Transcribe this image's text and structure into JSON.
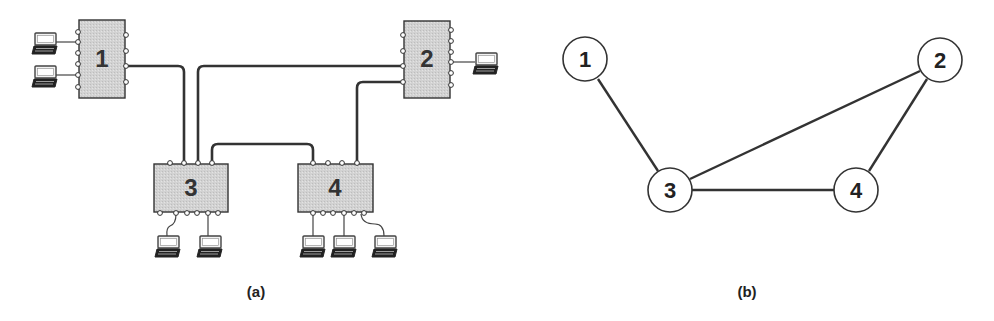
{
  "colors": {
    "stroke": "#333333",
    "switch_fill": "#d4d4d4",
    "node_fill": "#ffffff",
    "background": "#ffffff"
  },
  "panel_a": {
    "caption": "(a)",
    "switches": [
      {
        "id": "1",
        "label": "1",
        "x": 79,
        "y": 20,
        "w": 46,
        "h": 78
      },
      {
        "id": "2",
        "label": "2",
        "x": 404,
        "y": 21,
        "w": 46,
        "h": 77
      },
      {
        "id": "3",
        "label": "3",
        "x": 154,
        "y": 164,
        "w": 74,
        "h": 48
      },
      {
        "id": "4",
        "label": "4",
        "x": 298,
        "y": 164,
        "w": 75,
        "h": 48
      }
    ],
    "links": [
      {
        "from": "1",
        "to": "3"
      },
      {
        "from": "3",
        "to": "2"
      },
      {
        "from": "2",
        "to": "4"
      },
      {
        "from": "3",
        "to": "4"
      }
    ],
    "hosts": [
      {
        "attached_to": "1",
        "icon": "laptop-icon"
      },
      {
        "attached_to": "1",
        "icon": "laptop-icon"
      },
      {
        "attached_to": "2",
        "icon": "laptop-icon"
      },
      {
        "attached_to": "3",
        "icon": "laptop-icon"
      },
      {
        "attached_to": "3",
        "icon": "laptop-icon"
      },
      {
        "attached_to": "4",
        "icon": "laptop-icon"
      },
      {
        "attached_to": "4",
        "icon": "laptop-icon"
      },
      {
        "attached_to": "4",
        "icon": "laptop-icon"
      }
    ]
  },
  "panel_b": {
    "caption": "(b)",
    "nodes": [
      {
        "id": "1",
        "label": "1",
        "cx": 585,
        "cy": 59
      },
      {
        "id": "2",
        "label": "2",
        "cx": 940,
        "cy": 60
      },
      {
        "id": "3",
        "label": "3",
        "cx": 670,
        "cy": 190
      },
      {
        "id": "4",
        "label": "4",
        "cx": 856,
        "cy": 190
      }
    ],
    "edges": [
      {
        "from": "1",
        "to": "3"
      },
      {
        "from": "3",
        "to": "2"
      },
      {
        "from": "2",
        "to": "4"
      },
      {
        "from": "3",
        "to": "4"
      }
    ]
  }
}
